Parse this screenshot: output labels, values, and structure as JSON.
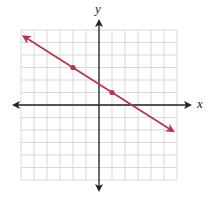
{
  "chart_data": {
    "type": "line",
    "title": "",
    "xlabel": "x",
    "ylabel": "y",
    "grid": true,
    "xlim": [
      -6,
      6
    ],
    "ylim": [
      -6,
      6
    ],
    "tick_labels_shown": false,
    "series": [
      {
        "name": "line",
        "color": "#b8334a",
        "slope": -0.6667,
        "y_intercept": 1.6667,
        "marked_points": [
          {
            "x": -2,
            "y": 3
          },
          {
            "x": 1,
            "y": 1
          }
        ],
        "arrow_ends": [
          {
            "x": -5.8,
            "y": 5.5
          },
          {
            "x": 5.7,
            "y": -2.1
          }
        ]
      }
    ]
  },
  "labels": {
    "x_axis": "x",
    "y_axis": "y"
  },
  "colors": {
    "grid": "#d9d9d9",
    "axis": "#222222",
    "line": "#b8334a"
  }
}
